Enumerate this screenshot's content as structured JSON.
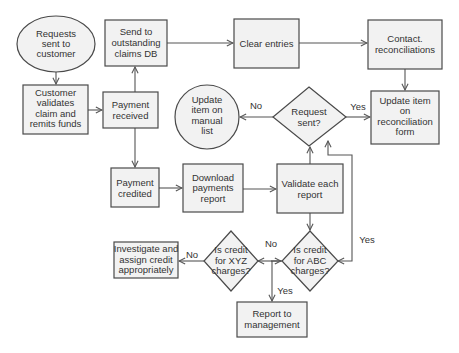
{
  "colors": {
    "shape_fill": "#f2f2f2",
    "shape_stroke": "#4a4a4a",
    "edge": "#555555",
    "text": "#333333",
    "background": "#ffffff"
  },
  "nodes": {
    "requests_sent": {
      "shape": "ellipse",
      "lines": [
        "Requests",
        "sent to",
        "customer"
      ]
    },
    "customer_validates": {
      "shape": "rect",
      "lines": [
        "Customer",
        "validates",
        "claim and",
        "remits funds"
      ]
    },
    "send_outstanding": {
      "shape": "rect",
      "lines": [
        "Send to",
        "outstanding",
        "claims DB"
      ]
    },
    "payment_received": {
      "shape": "rect",
      "lines": [
        "Payment",
        "received"
      ]
    },
    "clear_entries": {
      "shape": "rect",
      "lines": [
        "Clear entries"
      ]
    },
    "contact_reconciliations": {
      "shape": "rect",
      "lines": [
        "Contact.",
        "reconciliations"
      ]
    },
    "update_manual_list": {
      "shape": "circle",
      "lines": [
        "Update",
        "item on",
        "manual",
        "list"
      ]
    },
    "request_sent_decision": {
      "shape": "diamond",
      "lines": [
        "Request",
        "sent?"
      ]
    },
    "update_reconciliation_form": {
      "shape": "rect",
      "lines": [
        "Update item",
        "on",
        "reconciliation",
        "form"
      ]
    },
    "payment_credited": {
      "shape": "rect",
      "lines": [
        "Payment",
        "credited"
      ]
    },
    "download_report": {
      "shape": "rect",
      "lines": [
        "Download",
        "payments",
        "report"
      ]
    },
    "validate_report": {
      "shape": "rect",
      "lines": [
        "Validate each",
        "report"
      ]
    },
    "abc_decision": {
      "shape": "diamond",
      "lines": [
        "Is credit",
        "for ABC",
        "charges?"
      ]
    },
    "xyz_decision": {
      "shape": "diamond",
      "lines": [
        "Is credit",
        "for XYZ",
        "charges?"
      ]
    },
    "investigate": {
      "shape": "rect",
      "lines": [
        "Investigate and",
        "assign credit",
        "appropriately"
      ]
    },
    "report_management": {
      "shape": "rect",
      "lines": [
        "Report to",
        "management"
      ]
    }
  },
  "edge_labels": {
    "request_no": "No",
    "request_yes": "Yes",
    "abc_no": "No",
    "abc_yes": "Yes",
    "xyz_no": "No",
    "xyz_yes": "Yes"
  },
  "edges": [
    {
      "from": "requests_sent",
      "to": "customer_validates"
    },
    {
      "from": "customer_validates",
      "to": "payment_received"
    },
    {
      "from": "payment_received",
      "to": "send_outstanding"
    },
    {
      "from": "send_outstanding",
      "to": "clear_entries"
    },
    {
      "from": "clear_entries",
      "to": "contact_reconciliations"
    },
    {
      "from": "contact_reconciliations",
      "to": "update_reconciliation_form"
    },
    {
      "from": "request_sent_decision",
      "to": "update_reconciliation_form",
      "label": "Yes"
    },
    {
      "from": "request_sent_decision",
      "to": "update_manual_list",
      "label": "No"
    },
    {
      "from": "payment_received",
      "to": "payment_credited"
    },
    {
      "from": "payment_credited",
      "to": "download_report"
    },
    {
      "from": "download_report",
      "to": "validate_report"
    },
    {
      "from": "validate_report",
      "to": "request_sent_decision"
    },
    {
      "from": "validate_report",
      "to": "abc_decision"
    },
    {
      "from": "abc_decision",
      "to": "request_sent_decision",
      "label": "Yes"
    },
    {
      "from": "abc_decision",
      "to": "xyz_decision",
      "label": "No"
    },
    {
      "from": "xyz_decision",
      "to": "investigate",
      "label": "No"
    },
    {
      "from": "xyz_decision",
      "to": "report_management",
      "label": "Yes"
    }
  ]
}
